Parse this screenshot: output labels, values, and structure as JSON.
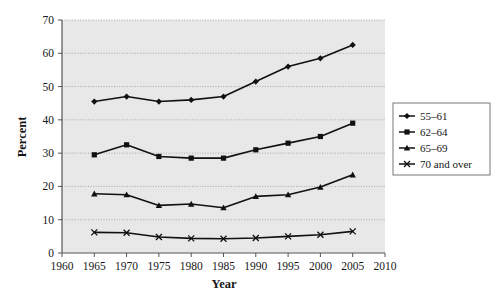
{
  "chart_data": {
    "type": "line",
    "title": "",
    "subtitle": "",
    "xlabel": "Year",
    "ylabel": "Percent",
    "xlim": [
      1960,
      2010
    ],
    "ylim": [
      0,
      70
    ],
    "xticks": [
      1960,
      1965,
      1970,
      1975,
      1980,
      1985,
      1990,
      1995,
      2000,
      2005,
      2010
    ],
    "yticks": [
      0,
      10,
      20,
      30,
      40,
      50,
      60,
      70
    ],
    "grid": true,
    "grid_axis": "y",
    "legend_position": "right",
    "plot_background": "#e8e8e8",
    "line_color": "#111111",
    "x": [
      1965,
      1970,
      1975,
      1980,
      1985,
      1990,
      1995,
      2000,
      2005
    ],
    "series": [
      {
        "name": "55–61",
        "marker": "diamond",
        "values": [
          45.5,
          47.0,
          45.5,
          46.0,
          47.0,
          51.5,
          56.0,
          58.5,
          62.5
        ]
      },
      {
        "name": "62–64",
        "marker": "square",
        "values": [
          29.5,
          32.5,
          29.0,
          28.5,
          28.5,
          31.0,
          33.0,
          35.0,
          39.0
        ]
      },
      {
        "name": "65–69",
        "marker": "triangle",
        "values": [
          17.8,
          17.5,
          14.3,
          14.7,
          13.6,
          17.0,
          17.5,
          19.8,
          23.5
        ]
      },
      {
        "name": "70 and over",
        "marker": "cross",
        "values": [
          6.2,
          6.1,
          4.8,
          4.4,
          4.3,
          4.5,
          5.0,
          5.5,
          6.5
        ]
      }
    ]
  },
  "legend": {
    "entries": [
      {
        "label": "55–61",
        "marker": "diamond"
      },
      {
        "label": "62–64",
        "marker": "square"
      },
      {
        "label": "65–69",
        "marker": "triangle"
      },
      {
        "label": "70 and over",
        "marker": "cross"
      }
    ]
  },
  "axes": {
    "x_title": "Year",
    "y_title": "Percent",
    "x_tick_labels": [
      "1960",
      "1965",
      "1970",
      "1975",
      "1980",
      "1985",
      "1990",
      "1995",
      "2000",
      "2005",
      "2010"
    ],
    "y_tick_labels": [
      "0",
      "10",
      "20",
      "30",
      "40",
      "50",
      "60",
      "70"
    ]
  }
}
